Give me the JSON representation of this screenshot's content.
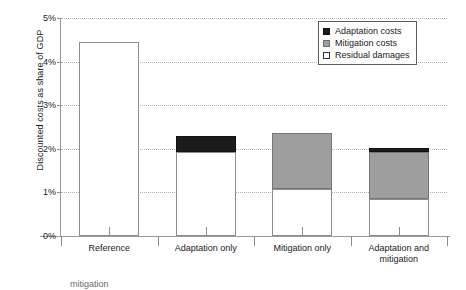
{
  "chart_data": {
    "type": "bar",
    "title": "",
    "xlabel": "",
    "ylabel": "Discounted costs as share of GDP",
    "categories": [
      "Reference",
      "Adaptation only",
      "Mitigation only",
      "Adaptation and mitigation"
    ],
    "ytick_labels": [
      "0%",
      "1%",
      "2%",
      "3%",
      "4%",
      "5%"
    ],
    "ytick_values": [
      0,
      1,
      2,
      3,
      4,
      5
    ],
    "ylim": [
      0,
      5
    ],
    "grid": "horizontal-dotted",
    "stacked": true,
    "legend_position": "top-right",
    "series": [
      {
        "name": "Residual damages",
        "color": "#ffffff",
        "values": [
          4.45,
          1.93,
          1.08,
          0.85
        ]
      },
      {
        "name": "Mitigation costs",
        "color": "#9e9e9e",
        "values": [
          0,
          0,
          1.28,
          1.07
        ]
      },
      {
        "name": "Adaptation costs",
        "color": "#1c1c1c",
        "values": [
          0,
          0.37,
          0,
          0.1
        ]
      }
    ],
    "totals": [
      4.45,
      2.3,
      2.36,
      2.02
    ]
  },
  "legend": {
    "items": [
      {
        "label": "Adaptation costs",
        "kind": "adaptation"
      },
      {
        "label": "Mitigation costs",
        "kind": "mitigation"
      },
      {
        "label": "Residual damages",
        "kind": "residual"
      }
    ]
  },
  "caption": {
    "text": "mitigation"
  }
}
